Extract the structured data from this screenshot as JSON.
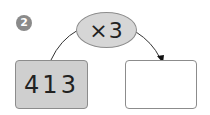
{
  "problem": {
    "number": "2"
  },
  "operator": {
    "label": "×3"
  },
  "input_box": {
    "value": "413"
  },
  "output_box": {
    "value": ""
  },
  "colors": {
    "badge": "#8a8a8a",
    "operator_fill": "#d6d6d6",
    "input_fill": "#cfcfcf",
    "output_fill": "#ffffff",
    "stroke": "#8c8c8c",
    "arrow": "#222222"
  }
}
